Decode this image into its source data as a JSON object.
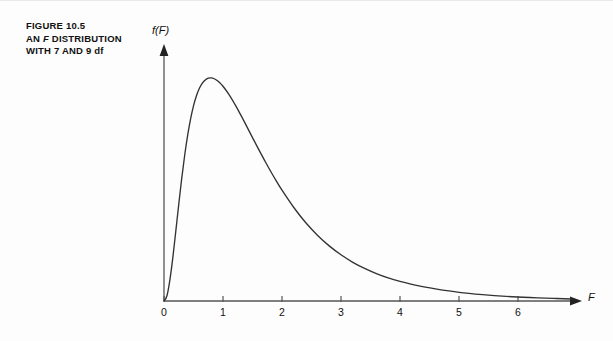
{
  "figure": {
    "caption_lines": [
      "FIGURE 10.5",
      "AN F DISTRIBUTION",
      "WITH 7 AND 9 df"
    ],
    "caption_line_1": "FIGURE 10.5",
    "caption_line_2_pre": "AN ",
    "caption_line_2_italic": "F",
    "caption_line_2_post": " DISTRIBUTION",
    "caption_line_3": "WITH 7 AND 9 df",
    "line_color": "#333333",
    "axis_color": "#555555",
    "text_color": "#111111",
    "background": "#fdfdfd"
  },
  "chart_data": {
    "type": "line",
    "title": "AN F DISTRIBUTION WITH 7 AND 9 df",
    "xlabel": "F",
    "ylabel": "f(F)",
    "grid": false,
    "legend": null,
    "xlim": [
      0,
      6.9
    ],
    "ylim": [
      0,
      0.88
    ],
    "xticks": [
      0,
      1,
      2,
      3,
      4,
      5,
      6
    ],
    "xtick_labels": [
      "0",
      "1",
      "2",
      "3",
      "4",
      "5",
      "6"
    ],
    "yticks": [],
    "ytick_labels": [],
    "distribution": {
      "name": "F",
      "df1": 7,
      "df2": 9,
      "mode": 0.72,
      "peak_density": 0.78
    },
    "x": [
      0.0,
      0.05,
      0.1,
      0.15,
      0.2,
      0.25,
      0.3,
      0.35,
      0.4,
      0.45,
      0.5,
      0.55,
      0.6,
      0.65,
      0.7,
      0.75,
      0.8,
      0.85,
      0.9,
      0.95,
      1.0,
      1.1,
      1.2,
      1.3,
      1.4,
      1.5,
      1.6,
      1.7,
      1.8,
      1.9,
      2.0,
      2.2,
      2.4,
      2.6,
      2.8,
      3.0,
      3.2,
      3.4,
      3.6,
      3.8,
      4.0,
      4.3,
      4.6,
      5.0,
      5.4,
      5.8,
      6.2,
      6.6,
      6.9
    ],
    "y": [
      0.0,
      0.018,
      0.073,
      0.151,
      0.242,
      0.335,
      0.424,
      0.504,
      0.573,
      0.63,
      0.676,
      0.711,
      0.737,
      0.755,
      0.766,
      0.772,
      0.773,
      0.77,
      0.764,
      0.755,
      0.744,
      0.716,
      0.682,
      0.645,
      0.606,
      0.566,
      0.527,
      0.489,
      0.452,
      0.417,
      0.384,
      0.324,
      0.272,
      0.228,
      0.191,
      0.16,
      0.134,
      0.113,
      0.095,
      0.08,
      0.068,
      0.053,
      0.042,
      0.03,
      0.022,
      0.016,
      0.012,
      0.009,
      0.007
    ]
  },
  "axes": {
    "y_axis_label": "f(F)",
    "x_axis_label": "F",
    "x_axis_arrow": "arrow-right",
    "y_axis_arrow": "arrow-up"
  }
}
